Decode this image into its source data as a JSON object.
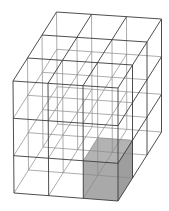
{
  "diagram": {
    "type": "wireframe-cube-grid",
    "grid": {
      "columns": 3,
      "rows": 3,
      "depth": 3
    },
    "projection": {
      "front_top_left": [
        13,
        81
      ],
      "front_top_right": [
        118,
        88
      ],
      "front_bottom_left": [
        14,
        193
      ],
      "front_bottom_right": [
        118,
        201
      ],
      "depth_vector_per_unit": [
        14.5,
        -23
      ]
    },
    "highlighted_cell": {
      "column": 2,
      "row": 2,
      "depth": 0
    },
    "colors": {
      "outer_edge": "#3a3a3a",
      "inner_edge": "#8a8a8a",
      "highlight_front": "#a9a9a9",
      "highlight_top": "#b3b3b3",
      "highlight_side": "#9e9e9e",
      "background": "#ffffff"
    }
  }
}
